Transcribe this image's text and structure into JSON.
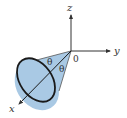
{
  "diagram": {
    "type": "3d-cone-axes",
    "labels": {
      "z_axis": "z",
      "y_axis": "y",
      "x_axis": "x",
      "origin": "0",
      "angle_upper": "θ",
      "angle_lower": "θ"
    },
    "colors": {
      "cone_fill": "#a9c9e4",
      "outline": "#1a1a1a",
      "axis": "#333333",
      "background": "#ffffff"
    }
  }
}
